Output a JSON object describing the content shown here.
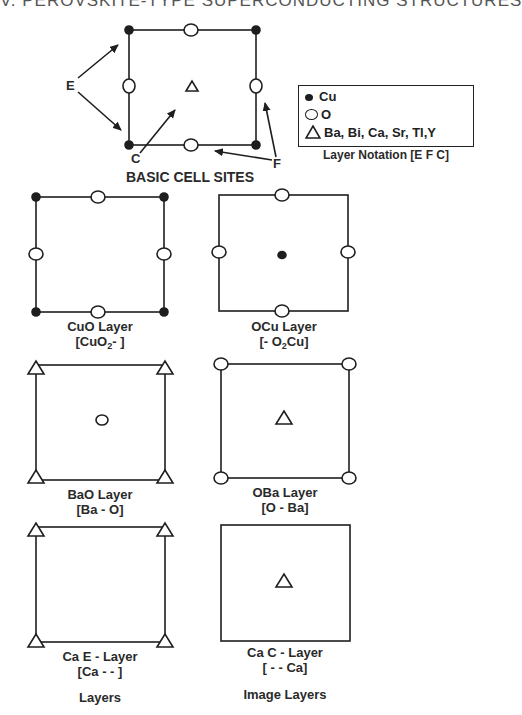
{
  "header": {
    "title": "V. PEROVSKITE-TYPE SUPERCONDUCTING STRUCTURES"
  },
  "basic_cell": {
    "title": "BASIC CELL SITES",
    "pointer_labels": {
      "e": "E",
      "c": "C",
      "f": "F"
    }
  },
  "legend": {
    "items": [
      {
        "symbol": "filled-circle",
        "label": "Cu"
      },
      {
        "symbol": "open-circle",
        "label": "O"
      },
      {
        "symbol": "triangle",
        "label": "Ba, Bi, Ca, Sr, Tl,Y"
      }
    ],
    "caption": "Layer Notation  [E F C]"
  },
  "layers": [
    {
      "name": "CuO Layer",
      "notation_pre": "[CuO",
      "notation_sub": "2",
      "notation_post": "- ]"
    },
    {
      "name": "OCu Layer",
      "notation_pre": "[- O",
      "notation_sub": "2",
      "notation_post": "Cu]"
    },
    {
      "name": "BaO Layer",
      "notation_pre": "[Ba - O]",
      "notation_sub": "",
      "notation_post": ""
    },
    {
      "name": "OBa Layer",
      "notation_pre": "[O - Ba]",
      "notation_sub": "",
      "notation_post": ""
    },
    {
      "name": "Ca  E - Layer",
      "notation_pre": "[Ca - - ]",
      "notation_sub": "",
      "notation_post": ""
    },
    {
      "name": "Ca  C - Layer",
      "notation_pre": "[ - - Ca]",
      "notation_sub": "",
      "notation_post": ""
    }
  ],
  "column_captions": {
    "left": "Layers",
    "right": "Image Layers"
  },
  "colors": {
    "ink": "#1e1e1e",
    "background": "#ffffff"
  }
}
